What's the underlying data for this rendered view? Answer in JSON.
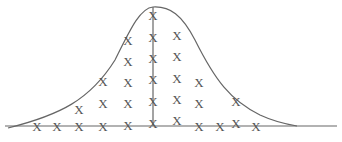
{
  "diagram": {
    "title": "",
    "marker": "X",
    "colors": {
      "line": "#666666",
      "marker": "#555555",
      "background": "#ffffff"
    },
    "baseline": {
      "x1": 5,
      "x2": 337,
      "y": 126
    },
    "center_line": {
      "x": 153,
      "y1": 7,
      "y2": 126
    },
    "curve_path": "M 8 128 C 60 115, 90 100, 115 60 C 130 30, 140 8, 153 7 C 170 6, 182 15, 195 40 C 215 80, 230 100, 260 115 C 275 122, 285 124, 297 126",
    "columns": [
      {
        "x": 37,
        "ys": [
          126
        ]
      },
      {
        "x": 57,
        "ys": [
          126
        ]
      },
      {
        "x": 79,
        "ys": [
          109,
          126
        ]
      },
      {
        "x": 103,
        "ys": [
          81,
          103,
          126
        ]
      },
      {
        "x": 128,
        "ys": [
          40,
          61,
          82,
          103,
          125
        ]
      },
      {
        "x": 153,
        "ys": [
          15,
          37,
          58,
          79,
          101,
          123
        ]
      },
      {
        "x": 177,
        "ys": [
          35,
          56,
          78,
          99,
          120
        ]
      },
      {
        "x": 199,
        "ys": [
          82,
          103,
          126
        ]
      },
      {
        "x": 220,
        "ys": [
          126
        ]
      },
      {
        "x": 236,
        "ys": [
          101,
          123
        ]
      },
      {
        "x": 256,
        "ys": [
          126
        ]
      }
    ]
  }
}
